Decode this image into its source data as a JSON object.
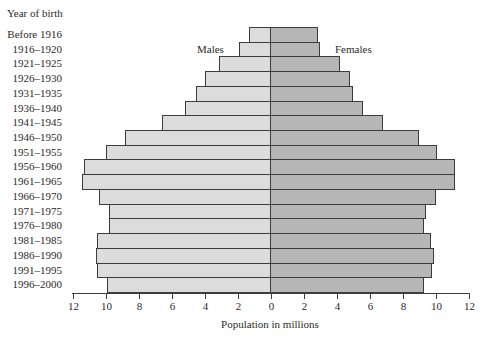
{
  "chart_data": {
    "type": "bar",
    "orientation": "horizontal",
    "subtype": "population-pyramid",
    "title": "",
    "ylabel": "Year of birth",
    "xlabel": "Population in millions",
    "xlim_left": [
      12,
      0
    ],
    "xlim_right": [
      0,
      12
    ],
    "x_ticks_left": [
      "12",
      "10",
      "8",
      "6",
      "4",
      "2",
      "0"
    ],
    "x_ticks_right": [
      "2",
      "4",
      "6",
      "8",
      "10",
      "12"
    ],
    "categories": [
      "Before 1916",
      "1916–1920",
      "1921–1925",
      "1926–1930",
      "1931–1935",
      "1936–1940",
      "1941–1945",
      "1946–1950",
      "1951–1955",
      "1956–1960",
      "1961–1965",
      "1966–1970",
      "1971–1975",
      "1976–1980",
      "1981–1985",
      "1986–1990",
      "1991–1995",
      "1996–2000"
    ],
    "series": [
      {
        "name": "Males",
        "side": "left",
        "color": "#dcdcdc",
        "values": [
          1.3,
          1.9,
          3.1,
          4.0,
          4.5,
          5.2,
          6.6,
          8.8,
          10.0,
          11.3,
          11.4,
          10.4,
          9.8,
          9.8,
          10.5,
          10.6,
          10.5,
          9.9
        ]
      },
      {
        "name": "Females",
        "side": "right",
        "color": "#b6b6b6",
        "values": [
          2.9,
          3.0,
          4.2,
          4.8,
          5.0,
          5.6,
          6.8,
          9.0,
          10.1,
          11.2,
          11.2,
          10.0,
          9.4,
          9.3,
          9.7,
          9.9,
          9.8,
          9.3
        ]
      }
    ],
    "grid": false,
    "legend": "inline labels near top (Males left, Females right)"
  },
  "labels": {
    "y_title": "Year of birth",
    "x_title": "Population in millions",
    "males": "Males",
    "females": "Females"
  }
}
